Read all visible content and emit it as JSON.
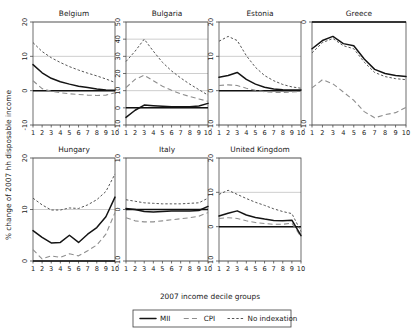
{
  "chart_data": {
    "type": "line",
    "title": "",
    "xlabel": "2007 income decile groups",
    "ylabel": "% change of 2007 hh disposable income",
    "grid": true,
    "legend_position": "bottom",
    "x": [
      1,
      2,
      3,
      4,
      5,
      6,
      7,
      8,
      9,
      10
    ],
    "xticklabels": [
      "1",
      "2",
      "3",
      "4",
      "5",
      "6",
      "7",
      "8",
      "9",
      "10"
    ],
    "legend": [
      {
        "name": "MII",
        "style": "solid",
        "color": "#141414"
      },
      {
        "name": "CPI",
        "style": "dashed",
        "color": "#8e8e8e"
      },
      {
        "name": "No indexation",
        "style": "fine-dashed",
        "color": "#555555"
      }
    ],
    "panels": [
      {
        "title": "Belgium",
        "ylim": [
          -10,
          20
        ],
        "yticks": [
          -10,
          0,
          10,
          20
        ],
        "yticklabels": [
          "-10",
          "0",
          "10",
          "20"
        ],
        "series": [
          {
            "name": "MII",
            "values": [
              7.6,
              5.2,
              3.6,
              2.6,
              1.9,
              1.3,
              0.9,
              0.5,
              0.2,
              0.1
            ]
          },
          {
            "name": "CPI",
            "values": [
              2.9,
              0.6,
              -0.2,
              -0.6,
              -0.9,
              -1.1,
              -1.3,
              -1.4,
              -1.3,
              -0.6
            ]
          },
          {
            "name": "No indexation",
            "values": [
              14.0,
              11.4,
              9.6,
              8.2,
              7.0,
              6.0,
              5.1,
              4.3,
              3.4,
              2.4
            ]
          }
        ]
      },
      {
        "title": "Bulgaria",
        "ylim": [
          -10,
          50
        ],
        "yticks": [
          -10,
          0,
          10,
          20,
          30,
          40,
          50
        ],
        "yticklabels": [
          "-10",
          "0",
          "10",
          "20",
          "30",
          "40",
          "50"
        ],
        "series": [
          {
            "name": "MII",
            "values": [
              -5.6,
              -1.4,
              1.6,
              1.2,
              0.9,
              0.7,
              0.6,
              0.7,
              1.1,
              2.6
            ]
          },
          {
            "name": "CPI",
            "values": [
              11.8,
              16.6,
              19.0,
              15.8,
              12.6,
              10.2,
              8.2,
              6.6,
              5.2,
              3.8
            ]
          },
          {
            "name": "No indexation",
            "values": [
              27.0,
              33.0,
              40.0,
              33.0,
              26.5,
              21.5,
              17.4,
              13.8,
              10.6,
              7.4
            ]
          }
        ]
      },
      {
        "title": "Estonia",
        "ylim": [
          -10,
          20
        ],
        "yticks": [
          -10,
          0,
          10,
          20
        ],
        "yticklabels": [
          "-10",
          "0",
          "10",
          "20"
        ],
        "series": [
          {
            "name": "MII",
            "values": [
              3.9,
              4.4,
              5.3,
              3.3,
              1.9,
              1.0,
              0.5,
              0.3,
              0.2,
              0.2
            ]
          },
          {
            "name": "CPI",
            "values": [
              1.5,
              1.7,
              1.5,
              0.7,
              0.1,
              -0.3,
              -0.5,
              -0.5,
              -0.4,
              -0.2
            ]
          },
          {
            "name": "No indexation",
            "values": [
              14.4,
              15.8,
              14.6,
              10.2,
              6.8,
              4.4,
              2.9,
              1.8,
              1.1,
              0.7
            ]
          }
        ]
      },
      {
        "title": "Greece",
        "ylim": [
          -10,
          0
        ],
        "yticks": [
          -10,
          0
        ],
        "yticklabels": [
          "-10",
          "0"
        ],
        "series": [
          {
            "name": "MII",
            "values": [
              -2.6,
              -1.8,
              -1.4,
              -2.1,
              -2.3,
              -3.6,
              -4.6,
              -5.0,
              -5.2,
              -5.3
            ]
          },
          {
            "name": "CPI",
            "values": [
              -6.4,
              -5.6,
              -6.0,
              -6.8,
              -7.6,
              -8.7,
              -9.3,
              -9.0,
              -8.8,
              -8.3
            ]
          },
          {
            "name": "No indexation",
            "values": [
              -3.0,
              -2.0,
              -1.6,
              -2.3,
              -2.6,
              -3.9,
              -4.9,
              -5.3,
              -5.5,
              -5.6
            ]
          }
        ]
      },
      {
        "title": "Hungary",
        "ylim": [
          0,
          20
        ],
        "yticks": [
          0,
          10,
          20
        ],
        "yticklabels": [
          "0",
          "10",
          "20"
        ],
        "series": [
          {
            "name": "MII",
            "values": [
              5.9,
              4.6,
              3.5,
              3.6,
              5.0,
              3.6,
              5.2,
              6.5,
              8.6,
              12.4
            ]
          },
          {
            "name": "CPI",
            "values": [
              2.2,
              0.4,
              1.0,
              0.7,
              1.4,
              1.0,
              2.0,
              3.1,
              5.2,
              9.4
            ]
          },
          {
            "name": "No indexation",
            "values": [
              12.2,
              10.9,
              9.9,
              9.9,
              10.3,
              10.2,
              10.9,
              11.9,
              13.5,
              16.9
            ]
          }
        ]
      },
      {
        "title": "Italy",
        "ylim": [
          -10,
          10
        ],
        "yticks": [
          -10,
          0,
          10
        ],
        "yticklabels": [
          "-10",
          "0",
          "10"
        ],
        "series": [
          {
            "name": "MII",
            "values": [
              0.2,
              0.0,
              -0.4,
              -0.5,
              -0.4,
              -0.3,
              -0.3,
              -0.3,
              -0.2,
              0.6
            ]
          },
          {
            "name": "CPI",
            "values": [
              -1.6,
              -2.2,
              -2.4,
              -2.4,
              -2.2,
              -2.0,
              -1.8,
              -1.6,
              -1.3,
              -0.6
            ]
          },
          {
            "name": "No indexation",
            "values": [
              1.9,
              1.6,
              1.3,
              1.2,
              1.1,
              1.1,
              1.1,
              1.2,
              1.3,
              2.2
            ]
          }
        ]
      },
      {
        "title": "United Kingdom",
        "ylim": [
          -10,
          20
        ],
        "yticks": [
          -10,
          0,
          10,
          20
        ],
        "yticklabels": [
          "-10",
          "0",
          "10",
          "20"
        ],
        "series": [
          {
            "name": "MII",
            "values": [
              3.1,
              3.9,
              4.6,
              3.4,
              2.7,
              2.2,
              1.8,
              1.7,
              1.9,
              -2.6
            ]
          },
          {
            "name": "CPI",
            "values": [
              2.4,
              2.6,
              2.4,
              1.7,
              1.2,
              0.9,
              0.7,
              0.7,
              1.0,
              -2.9
            ]
          },
          {
            "name": "No indexation",
            "values": [
              9.4,
              10.6,
              9.4,
              8.2,
              7.1,
              6.2,
              5.2,
              4.4,
              3.8,
              -1.4
            ]
          }
        ]
      }
    ]
  }
}
